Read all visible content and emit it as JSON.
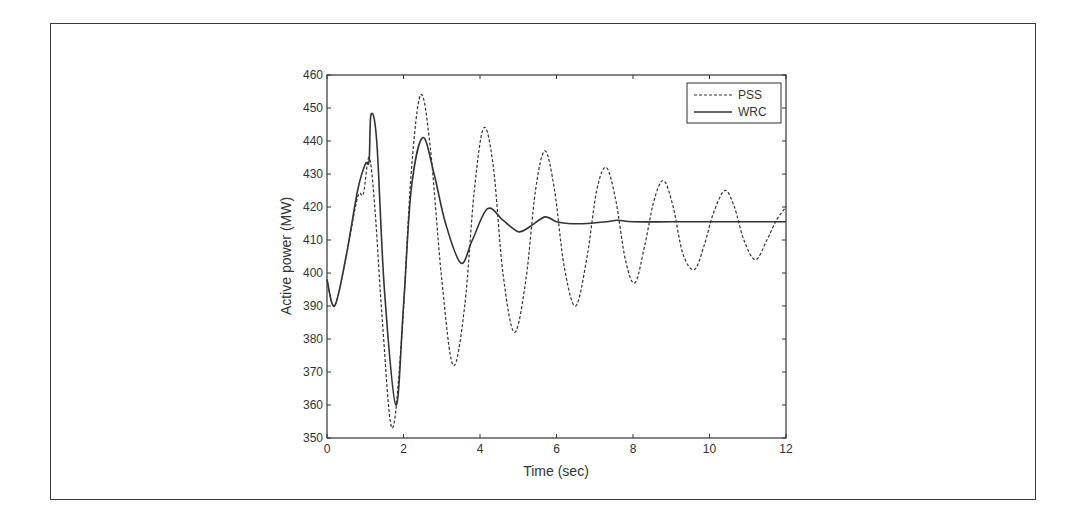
{
  "chart_data": {
    "type": "line",
    "title": "",
    "xlabel": "Time (sec)",
    "ylabel": "Active power (MW)",
    "xlim": [
      0,
      12
    ],
    "ylim": [
      350,
      460
    ],
    "xticks": [
      0,
      2,
      4,
      6,
      8,
      10,
      12
    ],
    "yticks": [
      350,
      360,
      370,
      380,
      390,
      400,
      410,
      420,
      430,
      440,
      450,
      460
    ],
    "grid": false,
    "legend_position": "upper right",
    "series": [
      {
        "name": "PSS",
        "style": "dashed",
        "color": "#333333",
        "x": [
          0,
          0.2,
          0.5,
          0.8,
          0.95,
          1.1,
          1.25,
          1.45,
          1.7,
          1.95,
          2.2,
          2.45,
          2.7,
          3.0,
          3.3,
          3.6,
          3.85,
          4.1,
          4.35,
          4.6,
          4.9,
          5.2,
          5.45,
          5.7,
          5.95,
          6.2,
          6.5,
          6.8,
          7.05,
          7.3,
          7.55,
          7.8,
          8.05,
          8.3,
          8.55,
          8.8,
          9.05,
          9.3,
          9.6,
          9.85,
          10.1,
          10.4,
          10.65,
          10.9,
          11.2,
          11.5,
          11.75,
          12.0
        ],
        "values": [
          398,
          390,
          405,
          423,
          424,
          435,
          420,
          385,
          353,
          380,
          430,
          454,
          438,
          398,
          372,
          390,
          425,
          444,
          432,
          400,
          382,
          398,
          425,
          437,
          425,
          402,
          390,
          405,
          425,
          432,
          422,
          404,
          397,
          408,
          422,
          428,
          420,
          406,
          401,
          408,
          418,
          425,
          420,
          410,
          404,
          410,
          416,
          420
        ]
      },
      {
        "name": "WRC",
        "style": "solid",
        "color": "#333333",
        "x": [
          0,
          0.2,
          0.5,
          0.8,
          1.0,
          1.1,
          1.15,
          1.3,
          1.5,
          1.8,
          2.0,
          2.2,
          2.5,
          2.8,
          3.1,
          3.5,
          3.8,
          4.2,
          4.6,
          5.0,
          5.3,
          5.7,
          6.0,
          6.3,
          6.8,
          7.3,
          7.6,
          8.0,
          9.0,
          10.0,
          11.0,
          12.0
        ],
        "values": [
          398,
          390,
          405,
          425,
          433,
          434,
          448,
          440,
          395,
          360,
          390,
          425,
          441,
          430,
          415,
          403,
          410,
          419.5,
          416,
          412.5,
          414,
          417,
          415.5,
          415,
          415,
          415.5,
          416,
          415.5,
          415.5,
          415.5,
          415.5,
          415.5
        ]
      }
    ]
  }
}
